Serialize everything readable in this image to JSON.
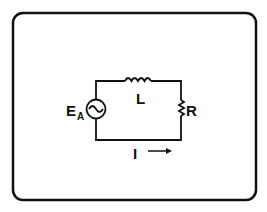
{
  "diagram": {
    "type": "series RL circuit",
    "labels": {
      "source": "E",
      "source_subscript": "A",
      "inductor": "L",
      "resistor": "R",
      "current": "I"
    },
    "components": [
      {
        "name": "ac-voltage-source",
        "label": "E_A"
      },
      {
        "name": "inductor",
        "label": "L"
      },
      {
        "name": "resistor",
        "label": "R"
      }
    ],
    "current_direction": "right",
    "colors": {
      "ink": "#111111",
      "background": "#ffffff"
    }
  }
}
